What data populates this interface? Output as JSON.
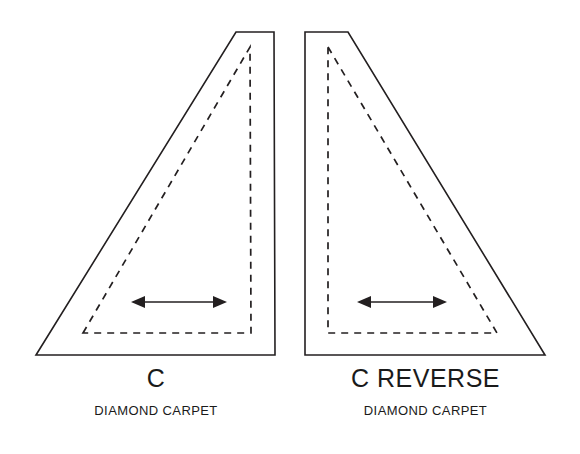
{
  "figure": {
    "background_color": "#ffffff",
    "line_color": "#231f20",
    "pieces": [
      {
        "code": "C",
        "description": "DIAMOND CARPET",
        "orientation": "left",
        "outline_points": "36,355 236,32 274,32 275,355",
        "stitch_points": "83,333 250,47 251,333",
        "pile_arrow": {
          "label": "pile-direction-arrow",
          "x1": 131,
          "x2": 227,
          "y": 302
        }
      },
      {
        "code": "C REVERSE",
        "description": "DIAMOND CARPET",
        "orientation": "right",
        "outline_points": "305,32 348,32 545,355 305,355",
        "stitch_points": "328,47 497,333 328,333",
        "pile_arrow": {
          "label": "pile-direction-arrow",
          "x1": 357,
          "x2": 447,
          "y": 302
        }
      }
    ]
  }
}
